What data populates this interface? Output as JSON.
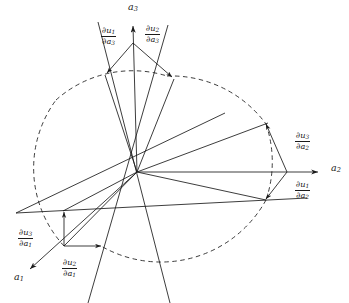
{
  "figure": {
    "background": "#ffffff",
    "stroke_color": "#1a1a1a",
    "dash_color": "#1a1a1a",
    "width": 349,
    "height": 303
  },
  "axes": [
    {
      "id": "a1",
      "label": "a",
      "subscript": "1",
      "label_x": 14,
      "label_y": 280,
      "tip_x": 31,
      "tip_y": 268
    },
    {
      "id": "a2",
      "label": "a",
      "subscript": "2",
      "label_x": 331,
      "label_y": 166,
      "tip_x": 322,
      "tip_y": 172
    },
    {
      "id": "a3",
      "label": "a",
      "subscript": "3",
      "label_x": 128,
      "label_y": 6,
      "tip_x": 133,
      "tip_y": 24
    }
  ],
  "origin": {
    "x": 137,
    "y": 172
  },
  "vector_labels": [
    {
      "id": "du1-da3",
      "numerator_op": "∂",
      "numerator_var": "u",
      "numerator_sub": "1",
      "denominator_op": "∂",
      "denominator_var": "a",
      "denominator_sub": "3",
      "x": 101,
      "y": 26
    },
    {
      "id": "du2-da3",
      "numerator_op": "∂",
      "numerator_var": "u",
      "numerator_sub": "2",
      "denominator_op": "∂",
      "denominator_var": "a",
      "denominator_sub": "3",
      "x": 145,
      "y": 24
    },
    {
      "id": "du3-da2",
      "numerator_op": "∂",
      "numerator_var": "u",
      "numerator_sub": "3",
      "denominator_op": "∂",
      "denominator_var": "a",
      "denominator_sub": "2",
      "x": 295,
      "y": 131
    },
    {
      "id": "du1-da2",
      "numerator_op": "∂",
      "numerator_var": "u",
      "numerator_sub": "1",
      "denominator_op": "∂",
      "denominator_var": "a",
      "denominator_sub": "2",
      "x": 295,
      "y": 180
    },
    {
      "id": "du3-da1",
      "numerator_op": "∂",
      "numerator_var": "u",
      "numerator_sub": "3",
      "denominator_op": "∂",
      "denominator_var": "a",
      "denominator_sub": "1",
      "x": 18,
      "y": 228
    },
    {
      "id": "du2-da1",
      "numerator_op": "∂",
      "numerator_var": "u",
      "numerator_sub": "2",
      "denominator_op": "∂",
      "denominator_var": "a",
      "denominator_sub": "1",
      "x": 62,
      "y": 258
    }
  ]
}
